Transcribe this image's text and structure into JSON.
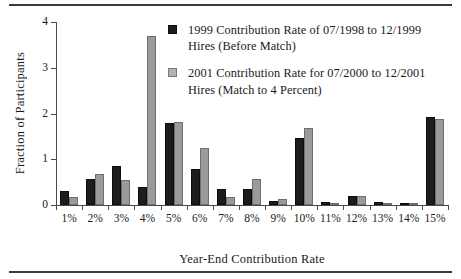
{
  "figure": {
    "ylabel": "Fraction of Participants",
    "xlabel": "Year-End Contribution Rate"
  },
  "legend": {
    "items": [
      {
        "marker": "black-square-icon",
        "color": "#1c1c1c",
        "line1": "1999 Contribution Rate of 07/1998 to 12/1999",
        "line2": "Hires (Before Match)"
      },
      {
        "marker": "grey-square-icon",
        "color": "#b3b3b3",
        "line1": "2001 Contribution Rate for 07/2000 to 12/2001",
        "line2": "Hires (Match to 4 Percent)"
      }
    ]
  },
  "chart_data": {
    "type": "bar",
    "title": "",
    "xlabel": "Year-End Contribution Rate",
    "ylabel": "Fraction of Participants",
    "categories": [
      "1%",
      "2%",
      "3%",
      "4%",
      "5%",
      "6%",
      "7%",
      "8%",
      "9%",
      "10%",
      "11%",
      "12%",
      "13%",
      "14%",
      "15%"
    ],
    "ylim": [
      0,
      4
    ],
    "yticks": [
      "0",
      "1",
      "2",
      "3",
      "4"
    ],
    "ytick_values": [
      0,
      1,
      2,
      3,
      4
    ],
    "grid": false,
    "legend_position": "upper-center",
    "series": [
      {
        "name": "1999 Contribution Rate of 07/1998 to 12/1999 Hires (Before Match)",
        "color": "#1c1c1c",
        "values": [
          0.31,
          0.57,
          0.86,
          0.4,
          1.8,
          0.78,
          0.34,
          0.36,
          0.08,
          1.47,
          0.07,
          0.2,
          0.07,
          0.04,
          1.93
        ]
      },
      {
        "name": "2001 Contribution Rate for 07/2000 to 12/2001 Hires (Match to 4 Percent)",
        "color": "#9a9a9a",
        "values": [
          0.17,
          0.67,
          0.55,
          3.7,
          1.82,
          1.25,
          0.17,
          0.57,
          0.14,
          1.68,
          0.05,
          0.2,
          0.04,
          0.02,
          1.88
        ]
      }
    ]
  }
}
